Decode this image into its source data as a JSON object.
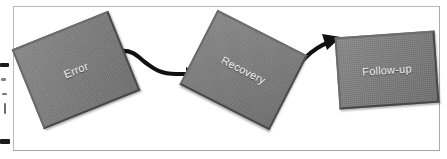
{
  "diagram": {
    "background_color": "#ffffff",
    "frame_color": "#b9b9b9",
    "node_fill_color": "#7c7c7c",
    "node_border_color": "#565656",
    "node_label_color": "#f2f2f2",
    "connector_color": "#111111",
    "nodes": [
      {
        "id": "error",
        "label": "Error",
        "rotation_deg": -22
      },
      {
        "id": "recovery",
        "label": "Recovery",
        "rotation_deg": 27
      },
      {
        "id": "followup",
        "label": "Follow-up",
        "rotation_deg": -4
      }
    ],
    "connectors": [
      {
        "id": "error-to-recovery",
        "from": "Error",
        "to": "Recovery",
        "style": "curved-arrow"
      },
      {
        "id": "recovery-to-followup",
        "from": "Recovery",
        "to": "Follow-up",
        "style": "curved-arrow"
      }
    ],
    "edge_marks": [
      {
        "id": "mark-1"
      },
      {
        "id": "mark-2"
      },
      {
        "id": "mark-3"
      },
      {
        "id": "mark-4"
      },
      {
        "id": "mark-5"
      }
    ]
  }
}
